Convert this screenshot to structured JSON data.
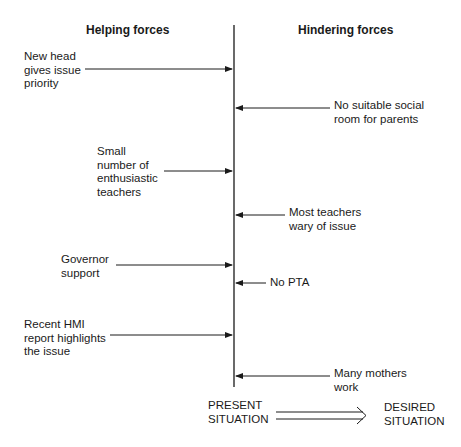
{
  "diagram": {
    "type": "force-field-analysis",
    "headings": {
      "helping": "Helping forces",
      "hindering": "Hindering forces"
    },
    "helping_forces": [
      {
        "label": "New head\ngives issue\npriority",
        "arrow_y": 69
      },
      {
        "label": "Small\nnumber of\nenthusiastic\nteachers",
        "arrow_y": 171
      },
      {
        "label": "Governor\nsupport",
        "arrow_y": 265
      },
      {
        "label": "Recent HMI\nreport highlights\nthe issue",
        "arrow_y": 335
      }
    ],
    "hindering_forces": [
      {
        "label": "No suitable social\nroom for parents",
        "arrow_y": 108
      },
      {
        "label": "Most teachers\nwary of issue",
        "arrow_y": 215
      },
      {
        "label": "No PTA",
        "arrow_y": 283
      },
      {
        "label": "Many mothers\nwork",
        "arrow_y": 376
      }
    ],
    "footer": {
      "present": "PRESENT\nSITUATION",
      "desired": "DESIRED\nSITUATION"
    },
    "colors": {
      "ink": "#1a1a1a",
      "background": "#ffffff"
    }
  }
}
